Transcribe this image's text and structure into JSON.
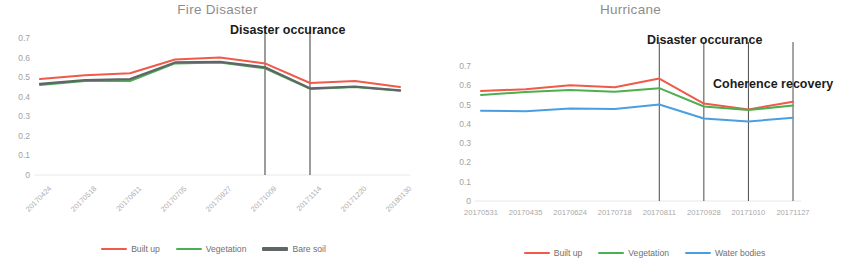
{
  "figure": {
    "background": "#ffffff",
    "width": 846,
    "height": 268
  },
  "colors": {
    "built_up": "#ef5a4a",
    "vegetation": "#4caf50",
    "bare_soil": "#5f6668",
    "water_bodies": "#4a9fe0",
    "axis_text": "#a6a6a6",
    "title_text": "#8d8d8d",
    "annotation_text": "#1c1c1c",
    "marker_line": "#4a4a4a",
    "gridline": "#e8e8e8"
  },
  "chart_data": [
    {
      "type": "line",
      "title": "Fire Disaster",
      "xlabel": "",
      "ylabel": "",
      "ylim": [
        0,
        0.7
      ],
      "yticks": [
        "0",
        "0.1",
        "0.2",
        "0.3",
        "0.4",
        "0.5",
        "0.6",
        "0.7"
      ],
      "ytick_values": [
        0,
        0.1,
        0.2,
        0.3,
        0.4,
        0.5,
        0.6,
        0.7
      ],
      "grid": false,
      "legend_position": "bottom",
      "xtick_rotation": 45,
      "categories": [
        "20170424",
        "20170518",
        "20170611",
        "20170705",
        "20170927",
        "20171009",
        "20171114",
        "20171220",
        "20180130"
      ],
      "series": [
        {
          "name": "Built up",
          "color": "#ef5a4a",
          "values": [
            0.49,
            0.51,
            0.52,
            0.59,
            0.6,
            0.57,
            0.47,
            0.48,
            0.45
          ]
        },
        {
          "name": "Vegetation",
          "color": "#4caf50",
          "values": [
            0.46,
            0.48,
            0.48,
            0.57,
            0.575,
            0.545,
            0.44,
            0.45,
            0.43
          ]
        },
        {
          "name": "Bare soil",
          "color": "#5f6668",
          "values": [
            0.465,
            0.485,
            0.49,
            0.575,
            0.578,
            0.55,
            0.443,
            0.452,
            0.432
          ]
        }
      ],
      "annotations": [
        {
          "label": "Disaster occurance",
          "marker_x_index": 5,
          "second_marker_x_index": 6
        }
      ]
    },
    {
      "type": "line",
      "title": "Hurricane",
      "xlabel": "",
      "ylabel": "",
      "ylim": [
        0,
        0.7
      ],
      "yticks": [
        "0",
        "0.1",
        "0.2",
        "0.3",
        "0.4",
        "0.5",
        "0.6",
        "0.7"
      ],
      "ytick_values": [
        0,
        0.1,
        0.2,
        0.3,
        0.4,
        0.5,
        0.6,
        0.7
      ],
      "grid": false,
      "legend_position": "bottom",
      "xtick_rotation": 0,
      "categories": [
        "20170531",
        "20170435",
        "20170624",
        "20170718",
        "20170811",
        "20170928",
        "20171010",
        "20171127"
      ],
      "series": [
        {
          "name": "Built up",
          "color": "#ef5a4a",
          "values": [
            0.57,
            0.58,
            0.6,
            0.59,
            0.635,
            0.505,
            0.475,
            0.515
          ]
        },
        {
          "name": "Vegetation",
          "color": "#4caf50",
          "values": [
            0.55,
            0.565,
            0.575,
            0.567,
            0.585,
            0.49,
            0.472,
            0.495
          ]
        },
        {
          "name": "Water bodies",
          "color": "#4a9fe0",
          "values": [
            0.468,
            0.465,
            0.48,
            0.477,
            0.5,
            0.428,
            0.412,
            0.432
          ]
        }
      ],
      "annotations": [
        {
          "label": "Disaster occurance",
          "marker_x_index": 4,
          "second_marker_x_index": 5
        },
        {
          "label": "Coherence recovery",
          "marker_x_index": 6,
          "second_marker_x_index": 7
        }
      ]
    }
  ]
}
